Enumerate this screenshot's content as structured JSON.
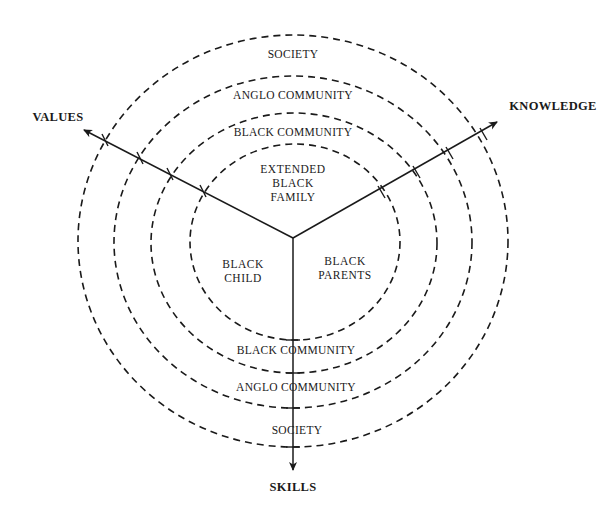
{
  "diagram": {
    "type": "concentric-rings-with-axes",
    "rings": [
      {
        "id": "society",
        "label": "SOCIETY",
        "bottom_label": "SOCIETY"
      },
      {
        "id": "anglo-community",
        "label": "ANGLO COMMUNITY",
        "bottom_label": "ANGLO COMMUNITY"
      },
      {
        "id": "black-community",
        "label": "BLACK COMMUNITY",
        "bottom_label": "BLACK COMMUNITY"
      },
      {
        "id": "inner-core",
        "label": ""
      }
    ],
    "inner_sectors": {
      "top": {
        "line1": "EXTENDED",
        "line2": "BLACK",
        "line3": "FAMILY"
      },
      "left": {
        "line1": "BLACK",
        "line2": "CHILD"
      },
      "right": {
        "line1": "BLACK",
        "line2": "PARENTS"
      }
    },
    "axes": {
      "values": "VALUES",
      "knowledge": "KNOWLEDGE",
      "skills": "SKILLS"
    },
    "colors": {
      "ink": "#1a1a1a",
      "background": "#ffffff"
    }
  }
}
